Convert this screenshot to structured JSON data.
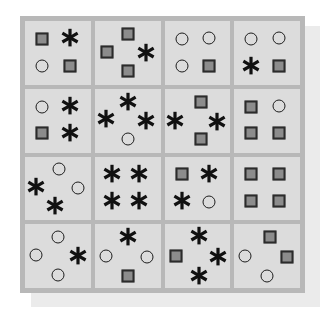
{
  "figure": {
    "colors": {
      "page_background": "#ffffff",
      "shadow_card": "#ebebeb",
      "board_frame": "#b8b8b8",
      "cell_background": "#dcdcdc",
      "square_fill": "#8c8c8c",
      "square_outline": "#2b2b2b",
      "circle_outline": "#1d1d1d",
      "asterisk_color": "#111111"
    },
    "grid": {
      "rows": 4,
      "columns": 4
    },
    "symbol_legend": [
      {
        "key": "square",
        "name": "filled-square",
        "label": "square"
      },
      {
        "key": "circle",
        "name": "hollow-circle",
        "label": "circle"
      },
      {
        "key": "asterisk",
        "name": "asterisk-star",
        "label": "asterisk"
      }
    ]
  },
  "chart_data": {
    "type": "heatmap",
    "xlabel": "",
    "ylabel": "",
    "categories": [
      "col-1",
      "col-2",
      "col-3",
      "col-4"
    ],
    "rows": [
      "row-1",
      "row-2",
      "row-3",
      "row-4"
    ],
    "counts_per_cell": {
      "r1c1": {
        "square": 2,
        "circle": 1,
        "asterisk": 1
      },
      "r1c2": {
        "square": 3,
        "circle": 0,
        "asterisk": 1
      },
      "r1c3": {
        "square": 1,
        "circle": 3,
        "asterisk": 0
      },
      "r1c4": {
        "square": 1,
        "circle": 2,
        "asterisk": 1
      },
      "r2c1": {
        "square": 1,
        "circle": 1,
        "asterisk": 2
      },
      "r2c2": {
        "square": 0,
        "circle": 1,
        "asterisk": 3
      },
      "r2c3": {
        "square": 2,
        "circle": 0,
        "asterisk": 2
      },
      "r2c4": {
        "square": 3,
        "circle": 1,
        "asterisk": 0
      },
      "r3c1": {
        "square": 0,
        "circle": 2,
        "asterisk": 2
      },
      "r3c2": {
        "square": 0,
        "circle": 0,
        "asterisk": 4
      },
      "r3c3": {
        "square": 1,
        "circle": 1,
        "asterisk": 2
      },
      "r3c4": {
        "square": 4,
        "circle": 0,
        "asterisk": 0
      },
      "r4c1": {
        "square": 0,
        "circle": 3,
        "asterisk": 1
      },
      "r4c2": {
        "square": 1,
        "circle": 2,
        "asterisk": 1
      },
      "r4c3": {
        "square": 1,
        "circle": 0,
        "asterisk": 3
      },
      "r4c4": {
        "square": 2,
        "circle": 2,
        "asterisk": 0
      }
    },
    "totals": {
      "square": 22,
      "circle": 19,
      "asterisk": 23
    }
  },
  "cells": [
    {
      "id": "r1c1",
      "row": 1,
      "col": 1,
      "layout": "quad",
      "items": [
        {
          "type": "square",
          "x": 26,
          "y": 28
        },
        {
          "type": "asterisk",
          "x": 68,
          "y": 27
        },
        {
          "type": "circle",
          "x": 26,
          "y": 70
        },
        {
          "type": "square",
          "x": 68,
          "y": 70
        }
      ]
    },
    {
      "id": "r1c2",
      "row": 1,
      "col": 2,
      "layout": "diamond",
      "items": [
        {
          "type": "square",
          "x": 50,
          "y": 20
        },
        {
          "type": "square",
          "x": 18,
          "y": 48
        },
        {
          "type": "asterisk",
          "x": 78,
          "y": 50
        },
        {
          "type": "square",
          "x": 50,
          "y": 78
        }
      ]
    },
    {
      "id": "r1c3",
      "row": 1,
      "col": 3,
      "layout": "quad",
      "items": [
        {
          "type": "circle",
          "x": 26,
          "y": 28
        },
        {
          "type": "circle",
          "x": 68,
          "y": 27
        },
        {
          "type": "circle",
          "x": 26,
          "y": 70
        },
        {
          "type": "square",
          "x": 68,
          "y": 70
        }
      ]
    },
    {
      "id": "r1c4",
      "row": 1,
      "col": 4,
      "layout": "quad",
      "items": [
        {
          "type": "circle",
          "x": 26,
          "y": 28
        },
        {
          "type": "circle",
          "x": 68,
          "y": 27
        },
        {
          "type": "asterisk",
          "x": 26,
          "y": 70
        },
        {
          "type": "square",
          "x": 68,
          "y": 70
        }
      ]
    },
    {
      "id": "r2c1",
      "row": 2,
      "col": 1,
      "layout": "quad",
      "items": [
        {
          "type": "circle",
          "x": 26,
          "y": 28
        },
        {
          "type": "asterisk",
          "x": 68,
          "y": 27
        },
        {
          "type": "square",
          "x": 26,
          "y": 70
        },
        {
          "type": "asterisk",
          "x": 68,
          "y": 70
        }
      ]
    },
    {
      "id": "r2c2",
      "row": 2,
      "col": 2,
      "layout": "diamond",
      "items": [
        {
          "type": "asterisk",
          "x": 50,
          "y": 20
        },
        {
          "type": "asterisk",
          "x": 17,
          "y": 48
        },
        {
          "type": "asterisk",
          "x": 78,
          "y": 50
        },
        {
          "type": "circle",
          "x": 50,
          "y": 79
        }
      ]
    },
    {
      "id": "r2c3",
      "row": 2,
      "col": 3,
      "layout": "diamond",
      "items": [
        {
          "type": "square",
          "x": 56,
          "y": 20
        },
        {
          "type": "asterisk",
          "x": 16,
          "y": 50
        },
        {
          "type": "asterisk",
          "x": 80,
          "y": 52
        },
        {
          "type": "square",
          "x": 56,
          "y": 79
        }
      ]
    },
    {
      "id": "r2c4",
      "row": 2,
      "col": 4,
      "layout": "quad",
      "items": [
        {
          "type": "square",
          "x": 26,
          "y": 28
        },
        {
          "type": "circle",
          "x": 68,
          "y": 27
        },
        {
          "type": "square",
          "x": 26,
          "y": 70
        },
        {
          "type": "square",
          "x": 68,
          "y": 70
        }
      ]
    },
    {
      "id": "r3c1",
      "row": 3,
      "col": 1,
      "layout": "diamond",
      "items": [
        {
          "type": "circle",
          "x": 52,
          "y": 20
        },
        {
          "type": "asterisk",
          "x": 16,
          "y": 48
        },
        {
          "type": "circle",
          "x": 80,
          "y": 50
        },
        {
          "type": "asterisk",
          "x": 46,
          "y": 78
        }
      ]
    },
    {
      "id": "r3c2",
      "row": 3,
      "col": 2,
      "layout": "quad",
      "items": [
        {
          "type": "asterisk",
          "x": 26,
          "y": 27
        },
        {
          "type": "asterisk",
          "x": 68,
          "y": 27
        },
        {
          "type": "asterisk",
          "x": 26,
          "y": 70
        },
        {
          "type": "asterisk",
          "x": 68,
          "y": 70
        }
      ]
    },
    {
      "id": "r3c3",
      "row": 3,
      "col": 3,
      "layout": "quad",
      "items": [
        {
          "type": "square",
          "x": 26,
          "y": 28
        },
        {
          "type": "asterisk",
          "x": 68,
          "y": 27
        },
        {
          "type": "asterisk",
          "x": 26,
          "y": 70
        },
        {
          "type": "circle",
          "x": 68,
          "y": 71
        }
      ]
    },
    {
      "id": "r3c4",
      "row": 3,
      "col": 4,
      "layout": "quad",
      "items": [
        {
          "type": "square",
          "x": 26,
          "y": 28
        },
        {
          "type": "square",
          "x": 68,
          "y": 28
        },
        {
          "type": "square",
          "x": 26,
          "y": 70
        },
        {
          "type": "square",
          "x": 68,
          "y": 70
        }
      ]
    },
    {
      "id": "r4c1",
      "row": 4,
      "col": 1,
      "layout": "diamond",
      "items": [
        {
          "type": "circle",
          "x": 50,
          "y": 20
        },
        {
          "type": "circle",
          "x": 17,
          "y": 48
        },
        {
          "type": "asterisk",
          "x": 80,
          "y": 50
        },
        {
          "type": "circle",
          "x": 50,
          "y": 79
        }
      ]
    },
    {
      "id": "r4c2",
      "row": 4,
      "col": 2,
      "layout": "diamond",
      "items": [
        {
          "type": "asterisk",
          "x": 50,
          "y": 20
        },
        {
          "type": "circle",
          "x": 17,
          "y": 50
        },
        {
          "type": "circle",
          "x": 80,
          "y": 51
        },
        {
          "type": "square",
          "x": 50,
          "y": 81
        }
      ]
    },
    {
      "id": "r4c3",
      "row": 4,
      "col": 3,
      "layout": "diamond",
      "items": [
        {
          "type": "asterisk",
          "x": 52,
          "y": 19
        },
        {
          "type": "square",
          "x": 18,
          "y": 50
        },
        {
          "type": "asterisk",
          "x": 82,
          "y": 51
        },
        {
          "type": "asterisk",
          "x": 52,
          "y": 81
        }
      ]
    },
    {
      "id": "r4c4",
      "row": 4,
      "col": 4,
      "layout": "diamond",
      "items": [
        {
          "type": "square",
          "x": 54,
          "y": 20
        },
        {
          "type": "circle",
          "x": 17,
          "y": 50
        },
        {
          "type": "square",
          "x": 80,
          "y": 52
        },
        {
          "type": "circle",
          "x": 50,
          "y": 81
        }
      ]
    }
  ]
}
